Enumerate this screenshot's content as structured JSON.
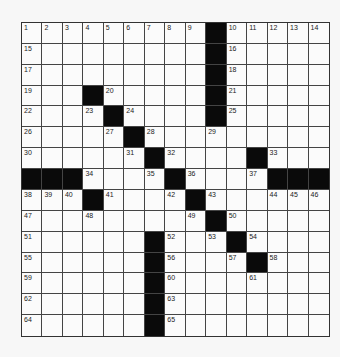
{
  "puzzle": {
    "rows": 15,
    "cols": 15,
    "colors": {
      "black": "#0a0a0a",
      "white": "#fbfbfb",
      "line": "#444444"
    },
    "grid": [
      "..............",
      "...............",
      "...............",
      "...............",
      "...............",
      "...............",
      "...............",
      "...............",
      "...............",
      "...............",
      "...............",
      "...............",
      "...............",
      "...............",
      "..............."
    ],
    "black_cells": [
      [
        0,
        9
      ],
      [
        1,
        9
      ],
      [
        2,
        9
      ],
      [
        3,
        3
      ],
      [
        3,
        9
      ],
      [
        4,
        4
      ],
      [
        4,
        9
      ],
      [
        5,
        5
      ],
      [
        6,
        6
      ],
      [
        6,
        11
      ],
      [
        7,
        0
      ],
      [
        7,
        1
      ],
      [
        7,
        2
      ],
      [
        7,
        7
      ],
      [
        7,
        12
      ],
      [
        7,
        13
      ],
      [
        7,
        14
      ],
      [
        8,
        3
      ],
      [
        8,
        8
      ],
      [
        9,
        9
      ],
      [
        10,
        6
      ],
      [
        10,
        10
      ],
      [
        11,
        6
      ],
      [
        11,
        11
      ],
      [
        12,
        6
      ],
      [
        13,
        6
      ],
      [
        14,
        6
      ]
    ],
    "numbers": [
      {
        "r": 0,
        "c": 0,
        "n": "1"
      },
      {
        "r": 0,
        "c": 1,
        "n": "2"
      },
      {
        "r": 0,
        "c": 2,
        "n": "3"
      },
      {
        "r": 0,
        "c": 3,
        "n": "4"
      },
      {
        "r": 0,
        "c": 4,
        "n": "5"
      },
      {
        "r": 0,
        "c": 5,
        "n": "6"
      },
      {
        "r": 0,
        "c": 6,
        "n": "7"
      },
      {
        "r": 0,
        "c": 7,
        "n": "8"
      },
      {
        "r": 0,
        "c": 8,
        "n": "9"
      },
      {
        "r": 0,
        "c": 10,
        "n": "10"
      },
      {
        "r": 0,
        "c": 11,
        "n": "11"
      },
      {
        "r": 0,
        "c": 12,
        "n": "12"
      },
      {
        "r": 0,
        "c": 13,
        "n": "13"
      },
      {
        "r": 0,
        "c": 14,
        "n": "14"
      },
      {
        "r": 1,
        "c": 0,
        "n": "15"
      },
      {
        "r": 1,
        "c": 10,
        "n": "16"
      },
      {
        "r": 2,
        "c": 0,
        "n": "17"
      },
      {
        "r": 2,
        "c": 10,
        "n": "18"
      },
      {
        "r": 3,
        "c": 0,
        "n": "19"
      },
      {
        "r": 3,
        "c": 4,
        "n": "20"
      },
      {
        "r": 3,
        "c": 10,
        "n": "21"
      },
      {
        "r": 4,
        "c": 0,
        "n": "22"
      },
      {
        "r": 4,
        "c": 3,
        "n": "23"
      },
      {
        "r": 4,
        "c": 5,
        "n": "24"
      },
      {
        "r": 4,
        "c": 10,
        "n": "25"
      },
      {
        "r": 5,
        "c": 0,
        "n": "26"
      },
      {
        "r": 5,
        "c": 4,
        "n": "27"
      },
      {
        "r": 5,
        "c": 6,
        "n": "28"
      },
      {
        "r": 5,
        "c": 9,
        "n": "29"
      },
      {
        "r": 6,
        "c": 0,
        "n": "30"
      },
      {
        "r": 6,
        "c": 5,
        "n": "31"
      },
      {
        "r": 6,
        "c": 7,
        "n": "32"
      },
      {
        "r": 6,
        "c": 12,
        "n": "33"
      },
      {
        "r": 7,
        "c": 3,
        "n": "34"
      },
      {
        "r": 7,
        "c": 6,
        "n": "35"
      },
      {
        "r": 7,
        "c": 8,
        "n": "36"
      },
      {
        "r": 7,
        "c": 11,
        "n": "37"
      },
      {
        "r": 8,
        "c": 0,
        "n": "38"
      },
      {
        "r": 8,
        "c": 1,
        "n": "39"
      },
      {
        "r": 8,
        "c": 2,
        "n": "40"
      },
      {
        "r": 8,
        "c": 4,
        "n": "41"
      },
      {
        "r": 8,
        "c": 7,
        "n": "42"
      },
      {
        "r": 8,
        "c": 9,
        "n": "43"
      },
      {
        "r": 8,
        "c": 12,
        "n": "44"
      },
      {
        "r": 8,
        "c": 13,
        "n": "45"
      },
      {
        "r": 8,
        "c": 14,
        "n": "46"
      },
      {
        "r": 9,
        "c": 0,
        "n": "47"
      },
      {
        "r": 9,
        "c": 3,
        "n": "48"
      },
      {
        "r": 9,
        "c": 8,
        "n": "49"
      },
      {
        "r": 9,
        "c": 10,
        "n": "50"
      },
      {
        "r": 10,
        "c": 0,
        "n": "51"
      },
      {
        "r": 10,
        "c": 7,
        "n": "52"
      },
      {
        "r": 10,
        "c": 9,
        "n": "53"
      },
      {
        "r": 10,
        "c": 11,
        "n": "54"
      },
      {
        "r": 11,
        "c": 0,
        "n": "55"
      },
      {
        "r": 11,
        "c": 7,
        "n": "56"
      },
      {
        "r": 11,
        "c": 10,
        "n": "57"
      },
      {
        "r": 11,
        "c": 12,
        "n": "58"
      },
      {
        "r": 12,
        "c": 0,
        "n": "59"
      },
      {
        "r": 12,
        "c": 7,
        "n": "60"
      },
      {
        "r": 12,
        "c": 11,
        "n": "61"
      },
      {
        "r": 13,
        "c": 0,
        "n": "62"
      },
      {
        "r": 13,
        "c": 7,
        "n": "63"
      },
      {
        "r": 14,
        "c": 0,
        "n": "64"
      },
      {
        "r": 14,
        "c": 7,
        "n": "65"
      }
    ]
  }
}
